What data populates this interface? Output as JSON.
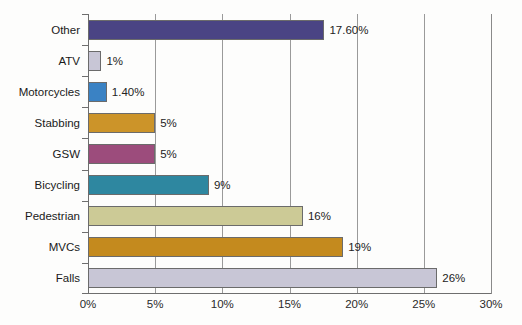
{
  "chart_data": {
    "type": "bar",
    "orientation": "horizontal",
    "title": "",
    "xlabel": "",
    "ylabel": "",
    "xlim": [
      0,
      30
    ],
    "xticks": [
      "0%",
      "5%",
      "10%",
      "15%",
      "20%",
      "25%",
      "30%"
    ],
    "xtick_values": [
      0,
      5,
      10,
      15,
      20,
      25,
      30
    ],
    "grid": "vertical",
    "legend": "none",
    "categories": [
      "Falls",
      "MVCs",
      "Pedestrian",
      "Bicycling",
      "GSW",
      "Stabbing",
      "Motorcycles",
      "ATV",
      "Other"
    ],
    "values": [
      26,
      19,
      16,
      9,
      5,
      5,
      1.4,
      1,
      17.6
    ],
    "bars": [
      {
        "label": "Other",
        "value": 17.6,
        "value_label": "17.60%",
        "color": "#4a4484"
      },
      {
        "label": "ATV",
        "value": 1,
        "value_label": "1%",
        "color": "#c8c6d6"
      },
      {
        "label": "Motorcycles",
        "value": 1.4,
        "value_label": "1.40%",
        "color": "#3a82c4"
      },
      {
        "label": "Stabbing",
        "value": 5,
        "value_label": "5%",
        "color": "#cc9429"
      },
      {
        "label": "GSW",
        "value": 5,
        "value_label": "5%",
        "color": "#9c4c7c"
      },
      {
        "label": "Bicycling",
        "value": 9,
        "value_label": "9%",
        "color": "#2e87a0"
      },
      {
        "label": "Pedestrian",
        "value": 16,
        "value_label": "16%",
        "color": "#ccca96"
      },
      {
        "label": "MVCs",
        "value": 19,
        "value_label": "19%",
        "color": "#c48a1e"
      },
      {
        "label": "Falls",
        "value": 26,
        "value_label": "26%",
        "color": "#c8c6d6"
      }
    ],
    "colors": {
      "bar_border": "#6b6b6b",
      "gridline": "#9a9a9a",
      "axis": "#6e6e6e",
      "background": "#fdfdfc",
      "text": "#1a1a1a"
    }
  }
}
